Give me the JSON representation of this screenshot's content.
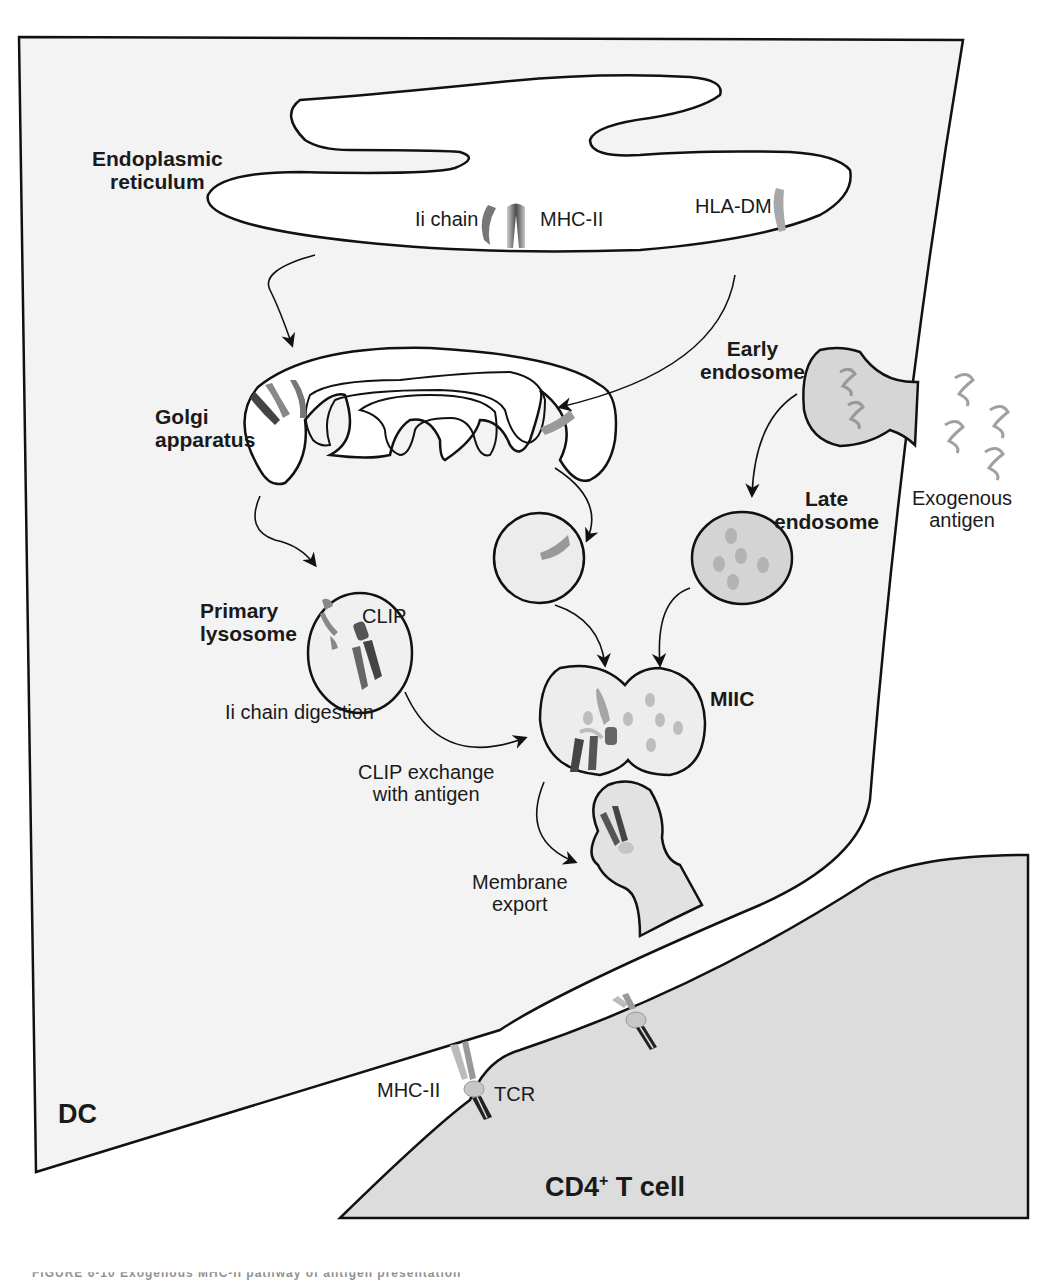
{
  "colors": {
    "outline": "#111111",
    "dc_fill": "#f2f2f2",
    "tcell_fill": "#dcdcdc",
    "vesicle_fill": "#e8e8e8",
    "late_endosome_fill": "#d4d4d4",
    "antigen_gray": "#9c9c9c",
    "protein_dark": "#555555",
    "protein_light": "#b0b0b0"
  },
  "labels": {
    "er_line1": "Endoplasmic",
    "er_line2": "reticulum",
    "ii_chain": "Ii chain",
    "mhc_ii_er": "MHC-II",
    "hla_dm": "HLA-DM",
    "golgi_line1": "Golgi",
    "golgi_line2": "apparatus",
    "early_endo_line1": "Early",
    "early_endo_line2": "endosome",
    "late_endo_line1": "Late",
    "late_endo_line2": "endosome",
    "exo_line1": "Exogenous",
    "exo_line2": "antigen",
    "primary_lyso_line1": "Primary",
    "primary_lyso_line2": "lysosome",
    "clip": "CLIP",
    "ii_digestion": "Ii chain digestion",
    "miic": "MIIC",
    "clip_exchange_line1": "CLIP exchange",
    "clip_exchange_line2": "with antigen",
    "membrane_line1": "Membrane",
    "membrane_line2": "export",
    "mhc_ii_synapse": "MHC-II",
    "tcr": "TCR",
    "dc": "DC",
    "tcell_prefix": "CD4",
    "tcell_sup": "+",
    "tcell_suffix": " T cell"
  },
  "caption": "FIGURE 6-10 Exogenous MHC-II pathway of antigen presentation"
}
